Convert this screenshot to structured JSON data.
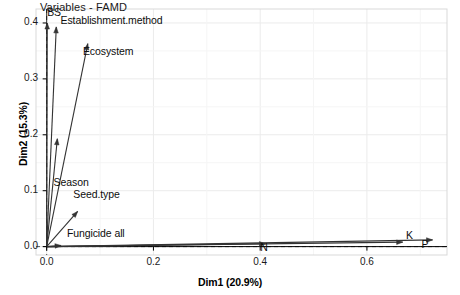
{
  "chart_data": {
    "type": "scatter",
    "subtype": "vector-loading-plot",
    "title": "Variables - FAMD",
    "xlabel": "Dim1 (20.9%)",
    "ylabel": "Dim2 (15.3%)",
    "xlim": [
      -0.02,
      0.75
    ],
    "ylim": [
      -0.015,
      0.425
    ],
    "xticks": [
      0.0,
      0.2,
      0.4,
      0.6
    ],
    "xtick_labels": [
      "0.0",
      "0.2",
      "0.4",
      "0.6"
    ],
    "yticks": [
      0.0,
      0.1,
      0.2,
      0.3,
      0.4
    ],
    "ytick_labels": [
      "0.0",
      "0.1",
      "0.2",
      "0.3",
      "0.4"
    ],
    "grid": true,
    "legend": "none",
    "origin_reference_lines": {
      "x": 0.0,
      "y": 0.0,
      "style": "dashed"
    },
    "variables": [
      {
        "name": "BS",
        "x": 0.001,
        "y": 0.4,
        "label_x": 0.001,
        "label_y": 0.418
      },
      {
        "name": "Establishment.method",
        "x": 0.018,
        "y": 0.393,
        "label_x": 0.026,
        "label_y": 0.403
      },
      {
        "name": "Ecosystem",
        "x": 0.077,
        "y": 0.363,
        "label_x": 0.068,
        "label_y": 0.348
      },
      {
        "name": "Season",
        "x": 0.02,
        "y": 0.193,
        "label_x": 0.013,
        "label_y": 0.113
      },
      {
        "name": "Seed.type",
        "x": 0.058,
        "y": 0.063,
        "label_x": 0.05,
        "label_y": 0.092
      },
      {
        "name": "Fungicide all",
        "x": 0.027,
        "y": 0.002,
        "label_x": 0.038,
        "label_y": 0.023
      },
      {
        "name": "N",
        "x": 0.41,
        "y": 0.005,
        "label_x": 0.4,
        "label_y": -0.003
      },
      {
        "name": "K",
        "x": 0.667,
        "y": 0.008,
        "label_x": 0.673,
        "label_y": 0.019
      },
      {
        "name": "P",
        "x": 0.723,
        "y": 0.012,
        "label_x": 0.702,
        "label_y": 0.003
      }
    ],
    "colors": {
      "arrow": "#333333",
      "grid": "#ebebeb",
      "panel_border": "#d9d9d9",
      "reference_line": "#555555",
      "text": "#0d0d0d",
      "background": "#ffffff"
    }
  }
}
